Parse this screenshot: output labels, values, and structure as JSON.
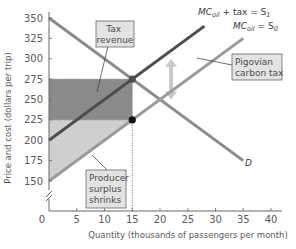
{
  "chart_data": {
    "type": "line",
    "title": "",
    "xlabel": "Quantity (thousands of passengers per month)",
    "ylabel": "Price and cost (dollars per trip)",
    "xlim": [
      0,
      40
    ],
    "ylim": [
      150,
      350
    ],
    "x_ticks": [
      0,
      5,
      10,
      15,
      20,
      25,
      30,
      35,
      40
    ],
    "x_tick_labels": [
      "0",
      "5",
      "10",
      "15",
      "20",
      "25",
      "30",
      "35",
      "40"
    ],
    "y_ticks": [
      150,
      175,
      200,
      225,
      250,
      275,
      300,
      325,
      350
    ],
    "y_tick_labels": [
      "150",
      "175",
      "200",
      "225",
      "250",
      "275",
      "300",
      "325",
      "350"
    ],
    "y_axis_break": true,
    "grid": false,
    "series": [
      {
        "name": "D",
        "label": "D",
        "color": "#8c8c8c",
        "points": [
          [
            0,
            350
          ],
          [
            35,
            175
          ]
        ]
      },
      {
        "name": "MC_oil + tax = S1",
        "label_main": "MC",
        "label_sub": "oil",
        "label_rest": " + tax = S",
        "label_rest_sub": "1",
        "color": "#4d4d4d",
        "points": [
          [
            0,
            200
          ],
          [
            28,
            340
          ]
        ]
      },
      {
        "name": "MC_oil = S0",
        "label_main": "MC",
        "label_sub": "oil",
        "label_rest": " = S",
        "label_rest_sub": "0",
        "color": "#9a9a9a",
        "points": [
          [
            0,
            150
          ],
          [
            35,
            325
          ]
        ]
      }
    ],
    "shaded_regions": [
      {
        "name": "tax-revenue-area",
        "color": "#8a8a8a",
        "x_range": [
          0,
          15
        ],
        "y_range": [
          225,
          275
        ]
      },
      {
        "name": "producer-surplus-shrink-area",
        "color": "#cfcfcf",
        "polygon": [
          [
            0,
            150
          ],
          [
            0,
            225
          ],
          [
            15,
            225
          ]
        ]
      }
    ],
    "markers": [
      {
        "name": "equilibrium-with-tax",
        "x": 15,
        "y": 275,
        "color": "#4d4d4d"
      },
      {
        "name": "equilibrium-without-tax",
        "x": 15,
        "y": 225,
        "color": "#111111"
      }
    ],
    "reference_lines": [
      {
        "name": "q-15-dotted",
        "x": 15,
        "from_y": 150,
        "to_y": 275
      },
      {
        "name": "p-275-dotted",
        "y": 275,
        "from_x": 0,
        "to_x": 15
      },
      {
        "name": "p-225-dotted",
        "y": 225,
        "from_x": 0,
        "to_x": 15
      }
    ],
    "arrow": {
      "name": "pigovian-tax-double-arrow",
      "x": 22,
      "from_y": 250,
      "to_y": 300,
      "color": "#c8c8c8"
    },
    "annotations": [
      {
        "name": "tax-revenue-callout",
        "lines": [
          "Tax",
          "revenue"
        ]
      },
      {
        "name": "pigovian-carbon-tax-callout",
        "lines": [
          "Pigovian",
          "carbon tax"
        ]
      },
      {
        "name": "producer-surplus-callout",
        "lines": [
          "Producer",
          "surplus",
          "shrinks"
        ]
      }
    ]
  }
}
